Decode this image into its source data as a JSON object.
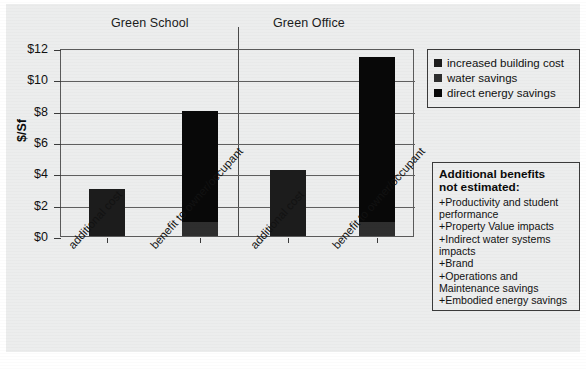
{
  "chart_data": {
    "type": "bar",
    "title": "",
    "subtitle": "",
    "stacked": true,
    "xlabel": "",
    "ylabel": "$/Sf",
    "ylim": [
      0,
      12
    ],
    "ytick_labels": [
      "$12",
      "$10",
      "$8",
      "$6",
      "$4",
      "$2",
      "$0"
    ],
    "ytick_values": [
      12,
      10,
      8,
      6,
      4,
      2,
      0
    ],
    "grid": true,
    "legend_position": "right",
    "groups": [
      "Green School",
      "Green Office"
    ],
    "categories": [
      "additional cost",
      "benefit to owner/occupant",
      "additional cost",
      "benefit to owner/occupant"
    ],
    "series": [
      {
        "name": "increased building cost",
        "color": "#1c1c1c",
        "values": [
          3.0,
          0,
          4.2,
          0
        ]
      },
      {
        "name": "water savings",
        "color": "#2e2e2e",
        "values": [
          0,
          0.9,
          0,
          0.9
        ]
      },
      {
        "name": "direct energy savings",
        "color": "#080808",
        "values": [
          0,
          7.1,
          0,
          10.5
        ]
      }
    ],
    "bar_totals": [
      3.0,
      8.0,
      4.2,
      11.4
    ],
    "annotations": []
  },
  "axis": {
    "y_title": "$/Sf",
    "y_ticks": [
      {
        "label": "$12",
        "value": 12
      },
      {
        "label": "$10",
        "value": 10
      },
      {
        "label": "$8",
        "value": 8
      },
      {
        "label": "$6",
        "value": 6
      },
      {
        "label": "$4",
        "value": 4
      },
      {
        "label": "$2",
        "value": 2
      },
      {
        "label": "$0",
        "value": 0
      }
    ]
  },
  "groups": [
    {
      "label": "Green School"
    },
    {
      "label": "Green Office"
    }
  ],
  "bars": [
    {
      "label": "additional cost",
      "total": 3.0
    },
    {
      "label": "benefit to owner/occupant",
      "total": 8.0
    },
    {
      "label": "additional cost",
      "total": 4.2
    },
    {
      "label": "benefit to owner/occupant",
      "total": 11.4
    }
  ],
  "legend": {
    "items": [
      {
        "label": "increased building cost",
        "swatch": "cost-swatch"
      },
      {
        "label": "water savings",
        "swatch": "water-swatch"
      },
      {
        "label": "direct energy savings",
        "swatch": "energy-swatch"
      }
    ]
  },
  "notes": {
    "heading_line1": "Additional benefits",
    "heading_line2": "not estimated:",
    "items": [
      "+Productivity and student performance",
      "+Property Value impacts",
      "+Indirect water systems impacts",
      "+Brand",
      "+Operations and Maintenance savings",
      "+Embodied energy savings"
    ]
  }
}
